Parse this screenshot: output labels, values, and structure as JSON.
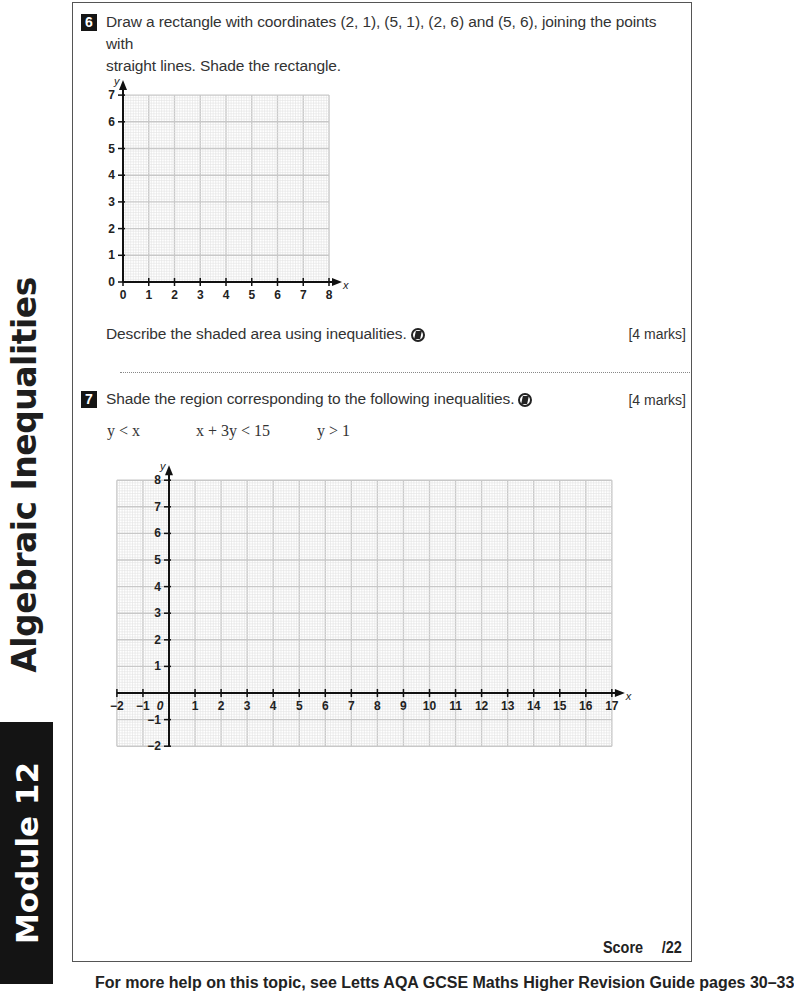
{
  "sidebar": {
    "chapter_title": "Algebraic Inequalities",
    "module_label": "Module 12"
  },
  "questions": [
    {
      "number": "6",
      "text_line1": "Draw a rectangle with coordinates (2, 1), (5, 1), (2, 6) and (5, 6), joining the points with",
      "text_line2": "straight lines. Shade the rectangle.",
      "subpart": "Describe the shaded area using inequalities.",
      "marks": "[4 marks]",
      "icon": "no-calculator-icon"
    },
    {
      "number": "7",
      "text": "Shade the region corresponding to the following inequalities.",
      "marks": "[4 marks]",
      "icon": "no-calculator-icon",
      "inequalities": [
        "y < x",
        "x + 3y < 15",
        "y > 1"
      ]
    }
  ],
  "score": {
    "label": "Score",
    "total": "/22"
  },
  "footer": {
    "text": "For more help on this topic, see Letts AQA GCSE Maths Higher Revision Guide pages 30–33"
  },
  "chart_data": [
    {
      "type": "grid",
      "title": "Question 6 axes",
      "xlabel": "x",
      "ylabel": "y",
      "xlim": [
        0,
        8
      ],
      "ylim": [
        0,
        7
      ],
      "x_ticks": [
        "0",
        "1",
        "2",
        "3",
        "4",
        "5",
        "6",
        "7",
        "8"
      ],
      "y_ticks": [
        "0",
        "1",
        "2",
        "3",
        "4",
        "5",
        "6",
        "7"
      ],
      "grid": true,
      "series": []
    },
    {
      "type": "grid",
      "title": "Question 7 axes",
      "xlabel": "x",
      "ylabel": "y",
      "xlim": [
        -2,
        17
      ],
      "ylim": [
        -2,
        8
      ],
      "x_ticks": [
        "-2",
        "-1",
        "0",
        "1",
        "2",
        "3",
        "4",
        "5",
        "6",
        "7",
        "8",
        "9",
        "10",
        "11",
        "12",
        "13",
        "14",
        "15",
        "16",
        "17"
      ],
      "y_ticks": [
        "-2",
        "-1",
        "1",
        "2",
        "3",
        "4",
        "5",
        "6",
        "7",
        "8"
      ],
      "grid": true,
      "series": []
    }
  ]
}
